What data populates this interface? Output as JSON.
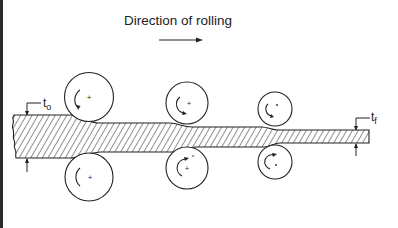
{
  "diagram": {
    "title": "Direction of rolling",
    "direction_arrow": "right-arrow",
    "labels": {
      "initial_thickness": {
        "main": "t",
        "sub": "o"
      },
      "final_thickness": {
        "main": "t",
        "sub": "f"
      }
    },
    "roll_stands": [
      {
        "name": "stand-1",
        "cx": 89,
        "top_cy": 97,
        "bottom_cy": 177,
        "r": 24
      },
      {
        "name": "stand-2",
        "cx": 187,
        "top_cy": 103,
        "bottom_cy": 168,
        "r": 21
      },
      {
        "name": "stand-3",
        "cx": 275,
        "top_cy": 110,
        "bottom_cy": 162,
        "r": 17
      }
    ],
    "strip": {
      "description": "hatched metal strip reducing in thickness through successive roll stands",
      "sections": [
        {
          "x_start": 12,
          "x_end": 65,
          "top": 115,
          "bottom": 158
        },
        {
          "x_start": 110,
          "x_end": 170,
          "top": 123,
          "bottom": 152
        },
        {
          "x_start": 205,
          "x_end": 262,
          "top": 127,
          "bottom": 147
        },
        {
          "x_start": 290,
          "x_end": 369,
          "top": 130,
          "bottom": 143
        }
      ]
    },
    "colors": {
      "line": "#222222",
      "background": "#ffffff",
      "border": "#2a2a2a"
    }
  }
}
